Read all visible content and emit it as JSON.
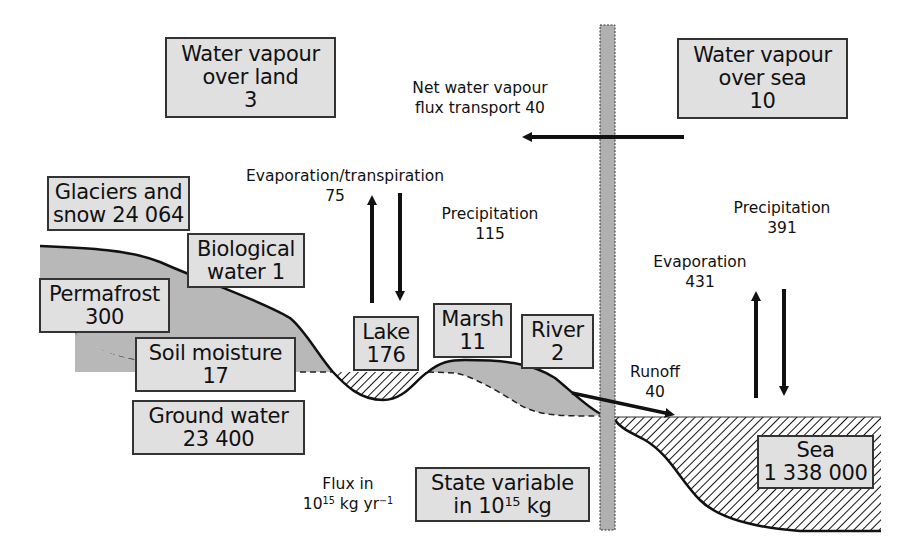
{
  "diagram": {
    "type": "water-cycle-box-model",
    "colors": {
      "box_fill": "#e0e0e0",
      "box_border": "#333333",
      "land_fill": "#b8b8b8",
      "divider_fill": "#b0b0b0",
      "ink": "#111111"
    },
    "stocks": {
      "vapour_land": {
        "line1": "Water vapour",
        "line2": "over land",
        "value": "3"
      },
      "vapour_sea": {
        "line1": "Water vapour",
        "line2": "over sea",
        "value": "10"
      },
      "glaciers": {
        "line1": "Glaciers and",
        "line2": "snow 24 064"
      },
      "biological": {
        "line1": "Biological",
        "line2": "water 1"
      },
      "permafrost": {
        "line1": "Permafrost",
        "value": "300"
      },
      "soil": {
        "line1": "Soil moisture",
        "value": "17"
      },
      "ground": {
        "line1": "Ground water",
        "value": "23 400"
      },
      "lake": {
        "line1": "Lake",
        "value": "176"
      },
      "marsh": {
        "line1": "Marsh",
        "value": "11"
      },
      "river": {
        "line1": "River",
        "value": "2"
      },
      "sea": {
        "line1": "Sea",
        "value": "1 338 000"
      }
    },
    "fluxes": {
      "net_transport": {
        "line1": "Net water vapour",
        "line2": "flux transport 40"
      },
      "land_evap": {
        "label": "Evaporation/transpiration",
        "value": "75"
      },
      "land_precip": {
        "label": "Precipitation",
        "value": "115"
      },
      "sea_precip": {
        "label": "Precipitation",
        "value": "391"
      },
      "sea_evap": {
        "label": "Evaporation",
        "value": "431"
      },
      "runoff": {
        "label": "Runoff",
        "value": "40"
      }
    },
    "legend": {
      "flux_line1": "Flux in",
      "flux_base": "10",
      "flux_exp": "15",
      "flux_unit": " kg yr",
      "flux_unit_exp": "−1",
      "state_line1": "State variable",
      "state_prefix": "in 10",
      "state_exp": "15",
      "state_unit": " kg"
    }
  }
}
